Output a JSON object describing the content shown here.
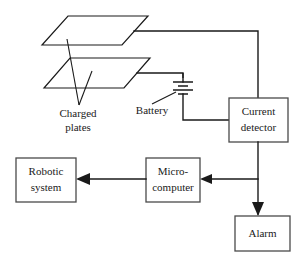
{
  "diagram": {
    "background_color": "#ffffff",
    "line_color": "#1a1a1a",
    "box_border_color": "#4a4a4a"
  },
  "boxes": {
    "current_detector": {
      "line1": "Current",
      "line2": "detector"
    },
    "robotic_system": {
      "line1": "Robotic",
      "line2": "system"
    },
    "microcomputer": {
      "line1": "Micro-",
      "line2": "computer"
    },
    "alarm": {
      "line1": "Alarm"
    }
  },
  "annotations": {
    "charged_plates": {
      "line1": "Charged",
      "line2": "plates"
    },
    "battery": {
      "label": "Battery"
    }
  },
  "components": {
    "upper_plate": "upper-charged-plate",
    "lower_plate": "lower-charged-plate",
    "battery_symbol": "battery-symbol",
    "ground_symbol": "ground-symbol"
  }
}
